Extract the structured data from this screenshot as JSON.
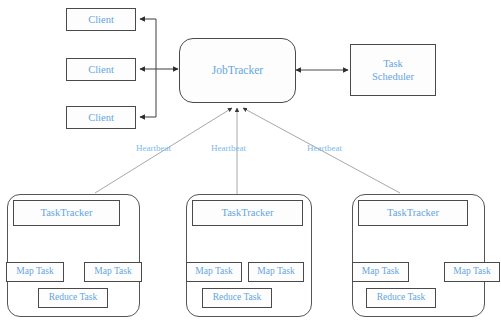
{
  "diagram": {
    "colors": {
      "node_text": "#64a6dd",
      "label_text": "#7dbbe8",
      "border": "#4a4a4a",
      "wire": "#9a9a9a",
      "background": "#ffffff"
    },
    "clients": [
      {
        "label": "Client"
      },
      {
        "label": "Client"
      },
      {
        "label": "Client"
      }
    ],
    "jobtracker": {
      "label": "JobTracker"
    },
    "scheduler": {
      "line1": "Task",
      "line2": "Scheduler"
    },
    "heartbeat_labels": [
      {
        "label": "Heartbeat"
      },
      {
        "label": "Heartbeat"
      },
      {
        "label": "Heartbeat"
      }
    ],
    "tracker_groups": [
      {
        "tracker_label": "TaskTracker",
        "map_task_left": "Map Task",
        "map_task_right": "Map Task",
        "reduce_task": "Reduce Task"
      },
      {
        "tracker_label": "TaskTracker",
        "map_task_left": "Map Task",
        "map_task_right": "Map Task",
        "reduce_task": "Reduce Task"
      },
      {
        "tracker_label": "TaskTracker",
        "map_task_left": "Map Task",
        "map_task_right": "Map Task",
        "reduce_task": "Reduce Task"
      }
    ]
  }
}
